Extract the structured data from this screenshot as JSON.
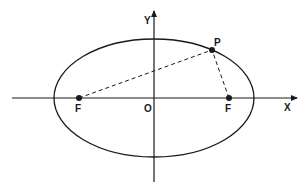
{
  "diagram": {
    "type": "ellipse-foci",
    "colors": {
      "stroke": "#1a1a1a",
      "background": "#ffffff"
    },
    "axes": {
      "x_label": "X",
      "y_label": "Y",
      "origin_label": "O"
    },
    "ellipse": {
      "cx": 154,
      "cy": 98,
      "rx": 100,
      "ry": 59
    },
    "points": {
      "focus_left": {
        "label": "F",
        "x": 79,
        "y": 98
      },
      "focus_right": {
        "label": "F",
        "x": 229,
        "y": 98
      },
      "point_p": {
        "label": "P",
        "x": 212,
        "y": 50
      }
    },
    "segments": [
      {
        "from": "focus_left",
        "to": "point_p",
        "style": "dashed"
      },
      {
        "from": "focus_right",
        "to": "point_p",
        "style": "dashed"
      }
    ]
  }
}
